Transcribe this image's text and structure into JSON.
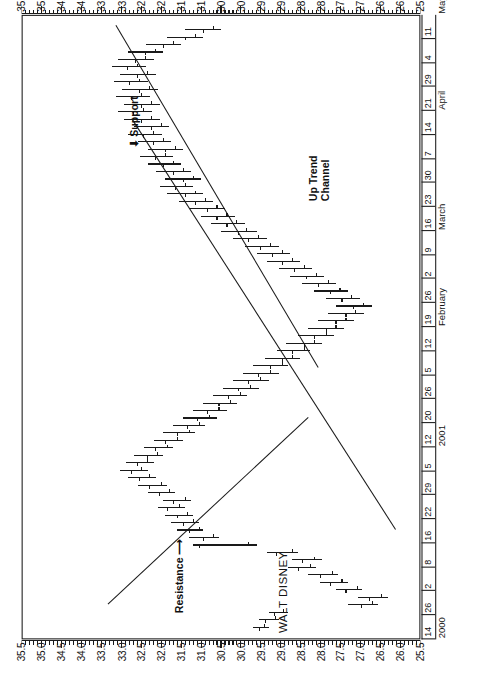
{
  "chart_data": {
    "type": "ohlc",
    "title": "WALT DISNEY",
    "xlabel": "",
    "ylabel": "",
    "ylim": [
      25.5,
      35.5
    ],
    "ytick_step": 0.5,
    "ytick_labels": [
      "35.5",
      "35.0",
      "34.5",
      "34.0",
      "33.5",
      "33.0",
      "32.5",
      "32.0",
      "31.5",
      "31.0",
      "30.5",
      "30.0",
      "29.5",
      "29.0",
      "28.5",
      "28.0",
      "27.5",
      "27.0",
      "26.5",
      "26.0",
      "25.5"
    ],
    "grid": false,
    "legend": "none",
    "orientation": "rotated-90-ccw",
    "date_axis": {
      "years": [
        {
          "label": "2000",
          "start_index": 0
        },
        {
          "label": "2001",
          "start_index": 8
        }
      ],
      "months": [
        {
          "label": "February",
          "start_index": 13
        },
        {
          "label": "March",
          "start_index": 17
        },
        {
          "label": "April",
          "start_index": 22
        },
        {
          "label": "May",
          "start_index": 26
        },
        {
          "label": "June",
          "start_index": 30
        }
      ],
      "week_ticks": [
        "14",
        "26",
        "2",
        "8",
        "16",
        "22",
        "29",
        "5",
        "12",
        "20",
        "26",
        "5",
        "12",
        "19",
        "26",
        "2",
        "9",
        "16",
        "23",
        "30",
        "7",
        "14",
        "21",
        "29",
        "4",
        "11"
      ]
    },
    "annotations": [
      {
        "label": "Resistance",
        "kind": "arrow-label"
      },
      {
        "label": "Support",
        "kind": "arrow-label"
      },
      {
        "label": "Up Trend\nChannel",
        "line1": "Up Trend",
        "line2": "Channel",
        "kind": "line-label"
      }
    ],
    "trendlines": [
      {
        "name": "resistance-line",
        "x1": 0.055,
        "y1": 33.35,
        "x2": 0.355,
        "y2": 28.3
      },
      {
        "name": "support-line",
        "x1": 0.175,
        "y1": 26.1,
        "x2": 0.835,
        "y2": 32.75
      },
      {
        "name": "uptrend-upper-line",
        "x1": 0.435,
        "y1": 28.05,
        "x2": 0.985,
        "y2": 33.15
      }
    ],
    "bars": [
      {
        "t": 0.018,
        "o": 29.52,
        "h": 29.7,
        "l": 29.28,
        "c": 29.4
      },
      {
        "t": 0.03,
        "o": 29.38,
        "h": 29.55,
        "l": 29.05,
        "c": 29.12
      },
      {
        "t": 0.042,
        "o": 29.15,
        "h": 29.3,
        "l": 28.8,
        "c": 28.92
      },
      {
        "t": 0.054,
        "o": 26.95,
        "h": 27.3,
        "l": 26.55,
        "c": 26.68
      },
      {
        "t": 0.066,
        "o": 26.75,
        "h": 27.05,
        "l": 26.3,
        "c": 26.45
      },
      {
        "t": 0.078,
        "o": 27.35,
        "h": 27.6,
        "l": 26.95,
        "c": 27.05
      },
      {
        "t": 0.09,
        "o": 27.75,
        "h": 28.0,
        "l": 27.3,
        "c": 27.45
      },
      {
        "t": 0.102,
        "o": 28.0,
        "h": 28.3,
        "l": 27.55,
        "c": 27.7
      },
      {
        "t": 0.114,
        "o": 28.55,
        "h": 28.8,
        "l": 28.1,
        "c": 28.25
      },
      {
        "t": 0.126,
        "o": 28.45,
        "h": 28.7,
        "l": 27.95,
        "c": 28.15
      },
      {
        "t": 0.138,
        "o": 29.1,
        "h": 29.35,
        "l": 28.55,
        "c": 28.7
      },
      {
        "t": 0.15,
        "o": 31.05,
        "h": 31.2,
        "l": 29.6,
        "c": 29.8
      },
      {
        "t": 0.162,
        "o": 30.95,
        "h": 31.3,
        "l": 30.55,
        "c": 30.7
      },
      {
        "t": 0.174,
        "o": 31.3,
        "h": 31.6,
        "l": 30.95,
        "c": 31.05
      },
      {
        "t": 0.186,
        "o": 31.45,
        "h": 31.75,
        "l": 31.05,
        "c": 31.2
      },
      {
        "t": 0.198,
        "o": 31.6,
        "h": 31.9,
        "l": 31.2,
        "c": 31.35
      },
      {
        "t": 0.21,
        "o": 31.85,
        "h": 32.1,
        "l": 31.4,
        "c": 31.55
      },
      {
        "t": 0.222,
        "o": 31.7,
        "h": 31.95,
        "l": 31.25,
        "c": 31.4
      },
      {
        "t": 0.234,
        "o": 32.05,
        "h": 32.35,
        "l": 31.65,
        "c": 31.8
      },
      {
        "t": 0.246,
        "o": 32.3,
        "h": 32.6,
        "l": 31.85,
        "c": 32.0
      },
      {
        "t": 0.258,
        "o": 32.55,
        "h": 32.85,
        "l": 32.15,
        "c": 32.3
      },
      {
        "t": 0.27,
        "o": 32.75,
        "h": 33.05,
        "l": 32.35,
        "c": 32.5
      },
      {
        "t": 0.282,
        "o": 32.6,
        "h": 32.9,
        "l": 32.2,
        "c": 32.35
      },
      {
        "t": 0.294,
        "o": 32.35,
        "h": 32.7,
        "l": 31.95,
        "c": 32.1
      },
      {
        "t": 0.306,
        "o": 32.15,
        "h": 32.45,
        "l": 31.7,
        "c": 31.85
      },
      {
        "t": 0.318,
        "o": 31.9,
        "h": 32.2,
        "l": 31.45,
        "c": 31.6
      },
      {
        "t": 0.33,
        "o": 31.6,
        "h": 31.95,
        "l": 31.15,
        "c": 31.3
      },
      {
        "t": 0.342,
        "o": 31.35,
        "h": 31.7,
        "l": 30.9,
        "c": 31.05
      },
      {
        "t": 0.354,
        "o": 31.1,
        "h": 31.45,
        "l": 30.6,
        "c": 30.8
      },
      {
        "t": 0.366,
        "o": 30.85,
        "h": 31.2,
        "l": 30.35,
        "c": 30.55
      },
      {
        "t": 0.378,
        "o": 30.55,
        "h": 30.95,
        "l": 30.1,
        "c": 30.25
      },
      {
        "t": 0.39,
        "o": 30.3,
        "h": 30.7,
        "l": 29.85,
        "c": 30.0
      },
      {
        "t": 0.402,
        "o": 30.05,
        "h": 30.45,
        "l": 29.55,
        "c": 29.75
      },
      {
        "t": 0.414,
        "o": 29.8,
        "h": 30.2,
        "l": 29.3,
        "c": 29.5
      },
      {
        "t": 0.426,
        "o": 29.55,
        "h": 29.95,
        "l": 29.05,
        "c": 29.25
      },
      {
        "t": 0.438,
        "o": 29.25,
        "h": 29.7,
        "l": 28.8,
        "c": 28.95
      },
      {
        "t": 0.45,
        "o": 28.95,
        "h": 29.4,
        "l": 28.5,
        "c": 28.7
      },
      {
        "t": 0.462,
        "o": 28.7,
        "h": 29.1,
        "l": 28.25,
        "c": 28.4
      },
      {
        "t": 0.474,
        "o": 28.4,
        "h": 28.85,
        "l": 27.95,
        "c": 28.15
      },
      {
        "t": 0.486,
        "o": 28.15,
        "h": 28.55,
        "l": 27.65,
        "c": 27.85
      },
      {
        "t": 0.498,
        "o": 27.85,
        "h": 28.3,
        "l": 27.4,
        "c": 27.6
      },
      {
        "t": 0.51,
        "o": 27.6,
        "h": 28.05,
        "l": 27.15,
        "c": 27.35
      },
      {
        "t": 0.522,
        "o": 27.35,
        "h": 27.8,
        "l": 26.9,
        "c": 27.1
      },
      {
        "t": 0.534,
        "o": 27.15,
        "h": 27.6,
        "l": 26.7,
        "c": 26.9
      },
      {
        "t": 0.546,
        "o": 27.45,
        "h": 27.85,
        "l": 27.0,
        "c": 27.2
      },
      {
        "t": 0.558,
        "o": 27.75,
        "h": 28.15,
        "l": 27.3,
        "c": 27.5
      },
      {
        "t": 0.57,
        "o": 28.05,
        "h": 28.45,
        "l": 27.6,
        "c": 27.8
      },
      {
        "t": 0.582,
        "o": 28.35,
        "h": 28.75,
        "l": 27.9,
        "c": 28.1
      },
      {
        "t": 0.594,
        "o": 28.65,
        "h": 29.05,
        "l": 28.2,
        "c": 28.4
      },
      {
        "t": 0.606,
        "o": 28.95,
        "h": 29.35,
        "l": 28.5,
        "c": 28.7
      },
      {
        "t": 0.618,
        "o": 29.2,
        "h": 29.6,
        "l": 28.75,
        "c": 28.95
      },
      {
        "t": 0.63,
        "o": 29.5,
        "h": 29.9,
        "l": 29.05,
        "c": 29.25
      },
      {
        "t": 0.642,
        "o": 29.8,
        "h": 30.2,
        "l": 29.35,
        "c": 29.55
      },
      {
        "t": 0.654,
        "o": 30.05,
        "h": 30.5,
        "l": 29.6,
        "c": 29.85
      },
      {
        "t": 0.666,
        "o": 30.35,
        "h": 30.75,
        "l": 29.9,
        "c": 30.1
      },
      {
        "t": 0.678,
        "o": 30.6,
        "h": 31.0,
        "l": 30.15,
        "c": 30.35
      },
      {
        "t": 0.69,
        "o": 30.85,
        "h": 31.3,
        "l": 30.4,
        "c": 30.6
      },
      {
        "t": 0.702,
        "o": 31.15,
        "h": 31.55,
        "l": 30.7,
        "c": 30.9
      },
      {
        "t": 0.714,
        "o": 31.4,
        "h": 31.85,
        "l": 30.95,
        "c": 31.15
      },
      {
        "t": 0.726,
        "o": 31.65,
        "h": 32.05,
        "l": 31.2,
        "c": 31.4
      },
      {
        "t": 0.738,
        "o": 31.45,
        "h": 31.9,
        "l": 31.0,
        "c": 31.2
      },
      {
        "t": 0.75,
        "o": 31.7,
        "h": 32.15,
        "l": 31.25,
        "c": 31.45
      },
      {
        "t": 0.762,
        "o": 31.95,
        "h": 32.35,
        "l": 31.5,
        "c": 31.7
      },
      {
        "t": 0.774,
        "o": 32.15,
        "h": 32.55,
        "l": 31.7,
        "c": 31.9
      },
      {
        "t": 0.786,
        "o": 31.9,
        "h": 32.35,
        "l": 31.45,
        "c": 31.65
      },
      {
        "t": 0.798,
        "o": 32.2,
        "h": 32.6,
        "l": 31.75,
        "c": 31.95
      },
      {
        "t": 0.81,
        "o": 32.45,
        "h": 32.85,
        "l": 32.0,
        "c": 32.2
      },
      {
        "t": 0.822,
        "o": 32.25,
        "h": 32.7,
        "l": 31.8,
        "c": 32.0
      },
      {
        "t": 0.834,
        "o": 32.5,
        "h": 32.95,
        "l": 32.05,
        "c": 32.25
      },
      {
        "t": 0.846,
        "o": 32.7,
        "h": 33.1,
        "l": 32.25,
        "c": 32.45
      },
      {
        "t": 0.858,
        "o": 32.5,
        "h": 32.95,
        "l": 32.05,
        "c": 32.25
      },
      {
        "t": 0.87,
        "o": 32.75,
        "h": 33.15,
        "l": 32.3,
        "c": 32.5
      },
      {
        "t": 0.882,
        "o": 32.55,
        "h": 33.0,
        "l": 32.1,
        "c": 32.3
      },
      {
        "t": 0.894,
        "o": 32.8,
        "h": 33.2,
        "l": 32.35,
        "c": 32.55
      },
      {
        "t": 0.906,
        "o": 32.6,
        "h": 33.05,
        "l": 32.15,
        "c": 32.35
      },
      {
        "t": 0.918,
        "o": 32.85,
        "h": 33.25,
        "l": 32.4,
        "c": 32.6
      },
      {
        "t": 0.93,
        "o": 32.65,
        "h": 33.1,
        "l": 32.2,
        "c": 32.4
      },
      {
        "t": 0.942,
        "o": 32.4,
        "h": 32.85,
        "l": 31.95,
        "c": 32.15
      },
      {
        "t": 0.954,
        "o": 31.95,
        "h": 32.4,
        "l": 31.5,
        "c": 31.7
      },
      {
        "t": 0.966,
        "o": 31.4,
        "h": 31.85,
        "l": 30.95,
        "c": 31.15
      },
      {
        "t": 0.978,
        "o": 30.95,
        "h": 31.4,
        "l": 30.5,
        "c": 30.7
      }
    ]
  }
}
